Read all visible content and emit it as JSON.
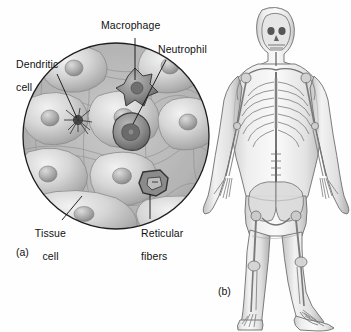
{
  "figure": {
    "background_color": "#ffffff",
    "line_color": "#1a1a1a"
  },
  "panel_a": {
    "caption": "(a)",
    "shape": "circular-micrograph",
    "center": [
      116,
      136
    ],
    "radius": 94,
    "labels": [
      {
        "id": "macrophage",
        "text": "Macrophage",
        "text_lines": [
          "Macrophage"
        ],
        "text_x": 101,
        "text_y": 27,
        "leader": {
          "x1": 135,
          "y1": 38,
          "x2": 135,
          "y2": 78
        }
      },
      {
        "id": "neutrophil",
        "text": "Neutrophil",
        "text_lines": [
          "Neutrophil"
        ],
        "text_x": 158,
        "text_y": 50,
        "leader": {
          "x1": 165,
          "y1": 61,
          "x2": 131,
          "y2": 124
        }
      },
      {
        "id": "dendritic-cell",
        "text": "Dendritic cell",
        "text_lines": [
          "Dendritic",
          "cell"
        ],
        "text_x": 10,
        "text_y": 53,
        "leader": {
          "x1": 57,
          "y1": 73,
          "x2": 77,
          "y2": 118
        }
      },
      {
        "id": "tissue-cell",
        "text": "Tissue cell",
        "text_lines": [
          "Tissue",
          "cell"
        ],
        "text_x": 27,
        "text_y": 222,
        "leader": {
          "x1": 63,
          "y1": 221,
          "x2": 82,
          "y2": 198
        }
      },
      {
        "id": "reticular-fibers",
        "text": "Reticular fibers",
        "text_lines": [
          "Reticular",
          "fibers"
        ],
        "text_x": 135,
        "text_y": 222,
        "leader": {
          "x1": 148,
          "y1": 220,
          "x2": 148,
          "y2": 196
        }
      }
    ],
    "caption_x": 16,
    "caption_y": 252
  },
  "panel_b": {
    "caption": "(b)",
    "shape": "human-body-skeleton-outline",
    "caption_x": 218,
    "caption_y": 291,
    "description": "Anterior view of a standing human body with the skeleton visible through a translucent body outline"
  },
  "colors": {
    "outline": "#1f1f1f",
    "cell_light": "#d9d9d9",
    "cell_mid": "#bdbdbd",
    "cell_dark": "#8e8e8e",
    "matrix": "#a9a9a9",
    "body_fill": "#e8e8e8",
    "bone": "#9a9a9a"
  }
}
